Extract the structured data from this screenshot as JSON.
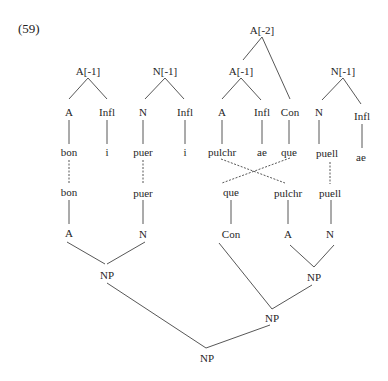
{
  "example_number": "(59)",
  "nodes": {
    "top_a_left": "A[-1]",
    "top_n_left": "N[-1]",
    "top_a2": "A[-2]",
    "top_a_mid": "A[-1]",
    "top_n_right": "N[-1]",
    "r1_a1": "A",
    "r1_infl1": "Infl",
    "r1_n1": "N",
    "r1_infl2": "Infl",
    "r1_a2": "A",
    "r1_infl3": "Infl",
    "r1_con": "Con",
    "r1_n2": "N",
    "r1_infl4": "Infl",
    "r2_bon": "bon",
    "r2_i1": "i",
    "r2_puer": "puer",
    "r2_i2": "i",
    "r2_pulchr": "pulchr",
    "r2_ae1": "ae",
    "r2_que": "que",
    "r2_puell": "puell",
    "r2_ae2": "ae",
    "r3_bon": "bon",
    "r3_puer": "puer",
    "r3_que": "que",
    "r3_pulchr": "pulchr",
    "r3_puell": "puell",
    "r4_a1": "A",
    "r4_n1": "N",
    "r4_con": "Con",
    "r4_a2": "A",
    "r4_n2": "N",
    "np_left": "NP",
    "np_right": "NP",
    "np_mid": "NP",
    "np_root": "NP"
  },
  "colors": {
    "line": "#444444",
    "text": "#262626"
  }
}
